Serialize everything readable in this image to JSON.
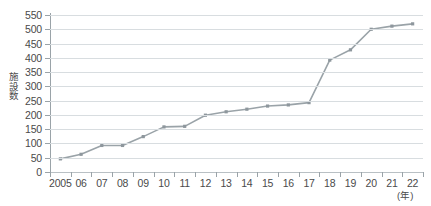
{
  "chart_data": {
    "type": "line",
    "title": "",
    "xlabel": "(年)",
    "ylabel": "施設数",
    "x": [
      "2005",
      "06",
      "07",
      "08",
      "09",
      "10",
      "11",
      "12",
      "13",
      "14",
      "15",
      "16",
      "17",
      "18",
      "19",
      "20",
      "21",
      "22"
    ],
    "categories": [
      "2005",
      "06",
      "07",
      "08",
      "09",
      "10",
      "11",
      "12",
      "13",
      "14",
      "15",
      "16",
      "17",
      "18",
      "19",
      "20",
      "21",
      "22"
    ],
    "values": [
      46,
      62,
      93,
      93,
      124,
      158,
      160,
      199,
      211,
      220,
      231,
      235,
      243,
      392,
      428,
      500,
      511,
      519
    ],
    "series": [
      {
        "name": "施設数",
        "values": [
          46,
          62,
          93,
          93,
          124,
          158,
          160,
          199,
          211,
          220,
          231,
          235,
          243,
          392,
          428,
          500,
          511,
          519
        ]
      }
    ],
    "ylim": [
      0,
      550
    ],
    "yticks": [
      0,
      50,
      100,
      150,
      200,
      250,
      300,
      350,
      400,
      450,
      500,
      550
    ],
    "ytick_labels": [
      "0",
      "50",
      "100",
      "150",
      "200",
      "250",
      "300",
      "350",
      "400",
      "450",
      "500",
      "550"
    ],
    "grid": true,
    "legend": "none",
    "marker": "square",
    "line_color": "#9aa3a8",
    "marker_color": "#8e979d",
    "grid_color": "#d8dde0",
    "axis_color": "#9aa3a8",
    "text_color": "#4a4a4a",
    "background": "#ffffff"
  }
}
